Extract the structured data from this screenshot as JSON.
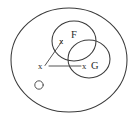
{
  "figure": {
    "type": "set-diagram",
    "background_color": "#ffffff",
    "stroke_color": "#3a3a3a"
  },
  "shapes": {
    "outer_ellipse": {
      "name": "universe-ellipse",
      "cx": 69,
      "cy": 60,
      "rx": 58,
      "ry": 52
    },
    "circle_f": {
      "name": "set-f-circle",
      "label": "F",
      "cx": 74,
      "cy": 41,
      "r": 22
    },
    "circle_g": {
      "name": "set-g-circle",
      "label": "G",
      "cx": 89,
      "cy": 59,
      "r": 21
    },
    "point_o": {
      "name": "point-o",
      "label": "O",
      "cx": 39,
      "cy": 85,
      "r": 4
    }
  },
  "labels": {
    "f": "F",
    "g": "G",
    "x_in_f": "x",
    "x_in_g": "x",
    "x_outside": "x",
    "o": "O"
  },
  "connectors": [
    {
      "name": "x-to-f-connector",
      "from_x": 44,
      "from_y": 65,
      "to_x": 62,
      "to_y": 40
    },
    {
      "name": "x-to-g-connector",
      "from_x": 48,
      "from_y": 66,
      "to_x": 82,
      "to_y": 66
    }
  ]
}
